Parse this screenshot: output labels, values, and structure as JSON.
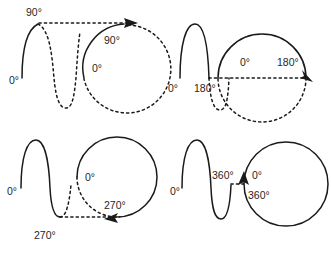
{
  "figure": {
    "background_color": "#ffffff",
    "line_color": "#1a1a1a",
    "panel_count": 4
  },
  "panels": [
    {
      "id": "panel-90",
      "name": "quarter-cycle-90-degrees",
      "angle_label": "90°",
      "start_label": "0°",
      "wave": {
        "start_label": "0°",
        "peak_label": "90°",
        "solid_portion_degrees": 90,
        "dashed_portion_degrees": 270
      },
      "circle": {
        "start_label": "0°",
        "end_label": "90°",
        "solid_arc_degrees": 90,
        "dashed_arc_degrees": 270,
        "arrow_position": "top",
        "rotation": "counterclockwise"
      }
    },
    {
      "id": "panel-180",
      "name": "half-cycle-180-degrees",
      "angle_label": "180°",
      "start_label": "0°",
      "wave": {
        "start_label": "0°",
        "zero_cross_label": "180°",
        "solid_portion_degrees": 180,
        "dashed_portion_degrees": 180
      },
      "circle": {
        "start_label": "0°",
        "end_label": "180°",
        "solid_arc_degrees": 180,
        "dashed_arc_degrees": 180,
        "arrow_position": "right",
        "rotation": "counterclockwise"
      }
    },
    {
      "id": "panel-270",
      "name": "three-quarter-cycle-270-degrees",
      "angle_label": "270°",
      "start_label": "0°",
      "wave": {
        "start_label": "0°",
        "trough_label": "270°",
        "solid_portion_degrees": 270,
        "dashed_portion_degrees": 90
      },
      "circle": {
        "start_label": "0°",
        "end_label": "270°",
        "solid_arc_degrees": 270,
        "dashed_arc_degrees": 90,
        "arrow_position": "bottom",
        "rotation": "counterclockwise"
      }
    },
    {
      "id": "panel-360",
      "name": "full-cycle-360-degrees",
      "angle_label": "360°",
      "start_label": "0°",
      "wave": {
        "start_label": "0°",
        "end_label": "360°",
        "solid_portion_degrees": 360,
        "dashed_portion_degrees": 0
      },
      "circle": {
        "start_label": "0°",
        "end_label": "360°",
        "solid_arc_degrees": 360,
        "dashed_arc_degrees": 0,
        "arrow_position": "left",
        "rotation": "counterclockwise"
      }
    }
  ],
  "labels": {
    "zero": "0°",
    "ninety": "90°",
    "one_eighty": "180°",
    "two_seventy": "270°",
    "three_sixty": "360°"
  }
}
